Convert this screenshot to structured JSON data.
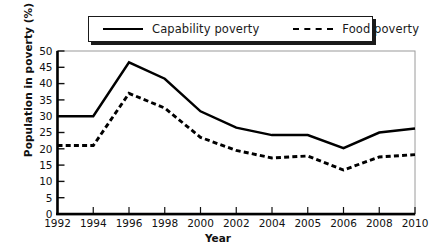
{
  "chart_data": {
    "type": "line",
    "title": "",
    "xlabel": "Year",
    "ylabel": "Population in poverty (%)",
    "categories": [
      "1992",
      "1994",
      "1996",
      "1998",
      "2000",
      "2002",
      "2004",
      "2005",
      "2006",
      "2008",
      "2010"
    ],
    "xtick_labels": [
      "1992",
      "1994",
      "1996",
      "1998",
      "2000",
      "2002",
      "2004",
      "2005",
      "2006",
      "2008",
      "2010"
    ],
    "ytick_labels": [
      "0",
      "5",
      "10",
      "15",
      "20",
      "25",
      "30",
      "35",
      "40",
      "45",
      "50"
    ],
    "yticks": [
      0,
      5,
      10,
      15,
      20,
      25,
      30,
      35,
      40,
      45,
      50
    ],
    "ylim": [
      0,
      50
    ],
    "grid": false,
    "legend_position": "top-center",
    "series": [
      {
        "name": "Capability poverty",
        "style": "solid",
        "color": "#000000",
        "values": [
          30,
          30,
          46.5,
          41.5,
          31.5,
          26.5,
          24.2,
          24.2,
          20.2,
          25.0,
          26.2
        ]
      },
      {
        "name": "Food poverty",
        "style": "dashed",
        "color": "#000000",
        "values": [
          21,
          21,
          37,
          32.5,
          23.5,
          19.5,
          17.2,
          17.8,
          13.5,
          17.5,
          18.2
        ]
      }
    ]
  },
  "legend": {
    "items": [
      {
        "label": "Capability poverty",
        "style": "solid"
      },
      {
        "label": "Food poverty",
        "style": "dashed"
      }
    ]
  },
  "axes": {
    "x_title": "Year",
    "y_title": "Population in poverty (%)"
  }
}
